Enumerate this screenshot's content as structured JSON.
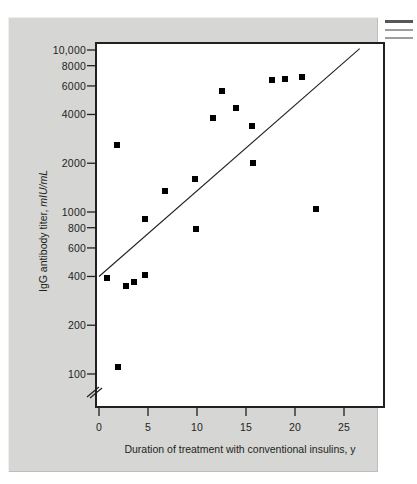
{
  "figure": {
    "background_color": "#d6d6d4",
    "plot_background_color": "#ffffff",
    "axis_color": "#231f20",
    "marker_color": "#000000"
  },
  "caption_stub": {
    "line1": "",
    "line2": "",
    "line3": ""
  },
  "chart_data": {
    "type": "scatter",
    "title": "",
    "subtitle": "",
    "xlabel": "Duration of treatment with conventional insulins, y",
    "ylabel": "IgG antibody titer, mIU/mL",
    "ylabel_text": "IgG antibody titer, ",
    "ylabel_unit": "mIU/mL",
    "xscale": "linear",
    "yscale": "log",
    "xlim": [
      0,
      29
    ],
    "ylim": [
      80,
      11500
    ],
    "grid": false,
    "legend": null,
    "axis_break": {
      "axis": "y",
      "present": true,
      "below_value": 100,
      "style": "double-slash"
    },
    "xticks": [
      0,
      5,
      10,
      15,
      20,
      25
    ],
    "xtick_labels": [
      "0",
      "5",
      "10",
      "15",
      "20",
      "25"
    ],
    "yticks": [
      100,
      200,
      400,
      600,
      800,
      1000,
      2000,
      4000,
      6000,
      8000,
      10000
    ],
    "ytick_labels": [
      "100",
      "200",
      "400",
      "600",
      "800",
      "1000",
      "2000",
      "4000",
      "6000",
      "8000",
      "10,000"
    ],
    "series": [
      {
        "name": "Patients",
        "marker": "square",
        "color": "#000000",
        "points": [
          {
            "x": 0.8,
            "y": 390
          },
          {
            "x": 1.8,
            "y": 2600
          },
          {
            "x": 1.9,
            "y": 110
          },
          {
            "x": 2.8,
            "y": 350
          },
          {
            "x": 3.6,
            "y": 370
          },
          {
            "x": 4.7,
            "y": 410
          },
          {
            "x": 4.7,
            "y": 910
          },
          {
            "x": 6.7,
            "y": 1350
          },
          {
            "x": 9.8,
            "y": 1600
          },
          {
            "x": 9.9,
            "y": 780
          },
          {
            "x": 11.6,
            "y": 3800
          },
          {
            "x": 12.6,
            "y": 5600
          },
          {
            "x": 14.0,
            "y": 4400
          },
          {
            "x": 15.6,
            "y": 3400
          },
          {
            "x": 15.7,
            "y": 2000
          },
          {
            "x": 17.7,
            "y": 6500
          },
          {
            "x": 19.0,
            "y": 6600
          },
          {
            "x": 20.7,
            "y": 6800
          },
          {
            "x": 22.1,
            "y": 1050
          }
        ]
      }
    ],
    "trendline": {
      "name": "regression-line",
      "color": "#231f20",
      "x_start": 0,
      "y_start": 400,
      "x_end": 26.6,
      "y_end": 10200
    }
  }
}
